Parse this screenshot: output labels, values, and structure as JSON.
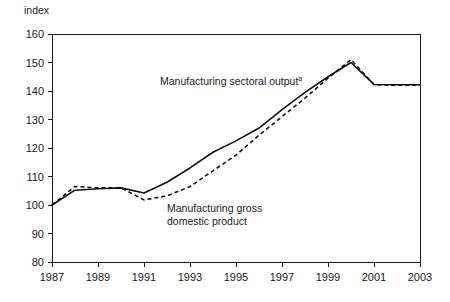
{
  "chart_data": {
    "type": "line",
    "title": "",
    "ylabel": "index",
    "xlabel": "",
    "ylim": [
      80,
      160
    ],
    "xlim": [
      1987,
      2003
    ],
    "grid": false,
    "legend_position": "inline-annotations",
    "y_ticks": [
      "80",
      "90",
      "100",
      "110",
      "120",
      "130",
      "140",
      "150",
      "160"
    ],
    "x_ticks": [
      "1987",
      "1989",
      "1991",
      "1993",
      "1995",
      "1997",
      "1999",
      "2001",
      "2003"
    ],
    "x": [
      1987,
      1988,
      1989,
      1990,
      1991,
      1992,
      1993,
      1994,
      1995,
      1996,
      1997,
      1998,
      1999,
      2000,
      2001,
      2002,
      2003
    ],
    "series": [
      {
        "name": "Manufacturing sectoral output",
        "style": "solid",
        "values": [
          100.0,
          105.2,
          105.7,
          106.0,
          104.2,
          108.0,
          113.0,
          118.5,
          122.5,
          127.0,
          133.5,
          139.5,
          145.0,
          150.0,
          142.3,
          142.2,
          142.2
        ]
      },
      {
        "name": "Manufacturing gross domestic product",
        "style": "dashed",
        "values": [
          100.0,
          106.5,
          106.0,
          106.0,
          101.8,
          103.2,
          106.5,
          112.0,
          117.5,
          124.5,
          131.0,
          137.5,
          144.5,
          151.0,
          142.2,
          142.0,
          142.0
        ]
      }
    ],
    "annotations": [
      {
        "id": "solid-series-label",
        "text": "Manufacturing sectoral output",
        "superscript": "a",
        "x_px": 160,
        "y_px": 85
      },
      {
        "id": "dashed-series-label-line1",
        "text": "Manufacturing gross",
        "x_px": 167,
        "y_px": 212
      },
      {
        "id": "dashed-series-label-line2",
        "text": "domestic product",
        "x_px": 167,
        "y_px": 225
      }
    ],
    "colors": {
      "line": "#111111",
      "axis": "#1a1a1a",
      "background": "#ffffff"
    }
  }
}
